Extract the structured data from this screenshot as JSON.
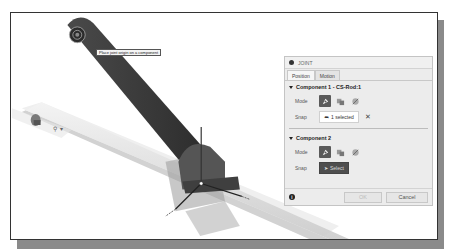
{
  "viewport": {
    "tooltip": "Place joint origin on a component",
    "mini_toolbar": {
      "icon": "joint-origin-icon",
      "dropdown_glyph": "▾"
    }
  },
  "joint_panel": {
    "title": "JOINT",
    "tabs": [
      {
        "label": "Position",
        "active": true
      },
      {
        "label": "Motion",
        "active": false
      }
    ],
    "component1": {
      "header": "Component 1 - CS-Rod:1",
      "mode_label": "Mode",
      "snap_label": "Snap",
      "snap_value": "1 selected",
      "clear_glyph": "✕"
    },
    "component2": {
      "header": "Component 2",
      "mode_label": "Mode",
      "snap_label": "Snap",
      "snap_value": "Select"
    },
    "footer": {
      "info_glyph": "i",
      "ok_label": "OK",
      "cancel_label": "Cancel"
    }
  },
  "colors": {
    "panel_bg": "#ececec",
    "active_mode": "#5a5a5a",
    "rod": "#3a3a3a",
    "frame_shadow": "#8a8a8a"
  }
}
